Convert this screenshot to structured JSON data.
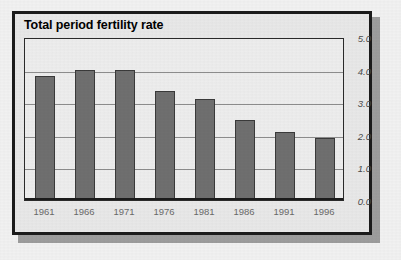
{
  "figure": {
    "title": "Total period fertility rate"
  },
  "chart_data": {
    "type": "bar",
    "title": "Total period fertility rate",
    "xlabel": "",
    "ylabel": "",
    "categories": [
      "1961",
      "1966",
      "1971",
      "1976",
      "1981",
      "1986",
      "1991",
      "1996"
    ],
    "values": [
      3.8,
      4.0,
      4.0,
      3.35,
      3.1,
      2.45,
      2.1,
      1.9
    ],
    "ylim": [
      0.0,
      5.0
    ],
    "ytick_labels": [
      "5.0",
      "4.0",
      "3.0",
      "2.0",
      "1.0",
      "0.0"
    ],
    "ytick_values": [
      5.0,
      4.0,
      3.0,
      2.0,
      1.0,
      0.0
    ],
    "grid": true,
    "legend": "none",
    "y_axis_position": "right",
    "colors": {
      "bar_fill": "#6f6f6f",
      "bar_outline": "#3a3a3a",
      "plot_background": "#e9e9e9",
      "gridline": "#8c8c8c",
      "frame": "#1b1b1b",
      "axis_label": "#4a4a4a",
      "category_label": "#6a6a6a",
      "title": "#000000"
    }
  }
}
